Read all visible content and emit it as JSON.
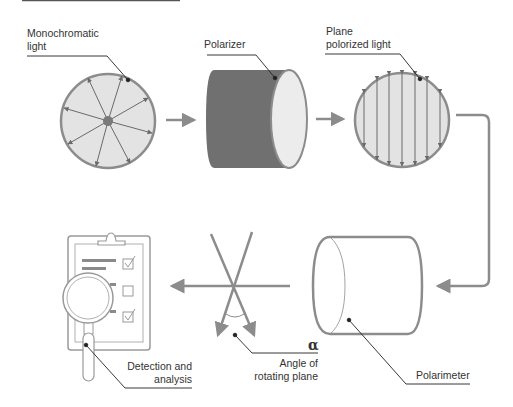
{
  "colors": {
    "stroke": "#8c8c8c",
    "fill_light": "#e3e3e3",
    "polarizer_body": "#707070",
    "polarizer_face": "#ececec",
    "text": "#333333",
    "leader": "#222222",
    "top_rule": "#555555"
  },
  "stages": [
    {
      "id": "monochromatic",
      "label_line1": "Monochromatic",
      "label_line2": "light"
    },
    {
      "id": "polarizer",
      "label_line1": "Polarizer"
    },
    {
      "id": "plane",
      "label_line1": "Plane",
      "label_line2": "polorized light"
    },
    {
      "id": "polarimeter",
      "label_line1": "Polarimeter"
    },
    {
      "id": "angle",
      "symbol": "α",
      "label_line1": "Angle of",
      "label_line2": "rotating plane"
    },
    {
      "id": "detection",
      "label_line1": "Detection and",
      "label_line2": "analysis"
    }
  ],
  "icons": [
    "light-wave-circle-icon",
    "polarizer-cylinder-icon",
    "polarized-light-circle-icon",
    "polarimeter-cylinder-icon",
    "rotation-angle-icon",
    "clipboard-magnifier-icon"
  ]
}
